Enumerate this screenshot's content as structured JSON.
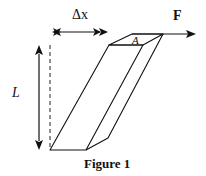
{
  "figure": {
    "caption": "Figure 1",
    "labels": {
      "delta_x": "Δx",
      "force": "F",
      "area": "A",
      "length": "L"
    }
  }
}
